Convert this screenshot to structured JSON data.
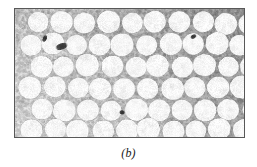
{
  "figure": {
    "caption": "(b)",
    "kind": "micrograph",
    "frame": {
      "x": 14,
      "y": 8,
      "width": 231,
      "height": 130,
      "border_color": "#585858"
    },
    "palette": {
      "page_background": "#ffffff",
      "matrix_light": "#d7d7d7",
      "matrix_mid": "#a8a8a8",
      "matrix_dark": "#6f6f6f",
      "particle_bright": "#fbfbfb",
      "particle_edge": "#dcdcdc",
      "inclusion_dark": "#2b2b2b",
      "caption_color": "#1a1a1a"
    },
    "micrograph_content": {
      "rows": 6,
      "columns_per_row": 10,
      "particle_shape": "circle",
      "particle_mean_radius_px": 11.5,
      "particle_radius_jitter_px": 2.2,
      "packing": "staggered hexagonal",
      "background_gradient": {
        "from": "lighter at lower-left",
        "to": "darker at upper-right"
      },
      "particle_grid": [
        {
          "row": 0,
          "cy": 14,
          "cxs": [
            24,
            48,
            71,
            95,
            119,
            142,
            166,
            190,
            213,
            237
          ],
          "radii": [
            10.5,
            11.5,
            11.0,
            11.8,
            10.6,
            11.4,
            11.2,
            10.9,
            11.6,
            10.4
          ]
        },
        {
          "row": 1,
          "cy": 36,
          "cxs": [
            15,
            38,
            62,
            86,
            109,
            133,
            157,
            180,
            204,
            228
          ],
          "radii": [
            11.0,
            11.7,
            10.8,
            11.3,
            11.9,
            10.7,
            11.5,
            11.1,
            11.8,
            10.9
          ]
        },
        {
          "row": 2,
          "cy": 58,
          "cxs": [
            26,
            50,
            73,
            97,
            121,
            144,
            168,
            192,
            215,
            239
          ],
          "radii": [
            11.4,
            10.6,
            11.9,
            11.2,
            10.8,
            11.6,
            11.0,
            11.7,
            10.5,
            11.3
          ]
        },
        {
          "row": 3,
          "cy": 80,
          "cxs": [
            16,
            40,
            63,
            87,
            111,
            134,
            158,
            182,
            205,
            229
          ],
          "radii": [
            11.8,
            11.1,
            10.7,
            11.5,
            11.2,
            10.9,
            11.7,
            11.0,
            11.4,
            11.9
          ]
        },
        {
          "row": 4,
          "cy": 102,
          "cxs": [
            27,
            51,
            74,
            98,
            122,
            145,
            169,
            193,
            216,
            240
          ],
          "radii": [
            10.9,
            11.6,
            11.2,
            10.6,
            11.8,
            11.3,
            10.8,
            11.5,
            11.1,
            10.7
          ]
        },
        {
          "row": 5,
          "cy": 123,
          "cxs": [
            17,
            41,
            64,
            88,
            112,
            135,
            159,
            183,
            206,
            230
          ],
          "radii": [
            11.3,
            10.8,
            11.7,
            11.0,
            11.4,
            11.9,
            11.2,
            10.6,
            11.6,
            11.1
          ]
        }
      ],
      "dark_inclusions": [
        {
          "cx": 47,
          "cy": 38,
          "rx": 6.5,
          "ry": 3.2,
          "rotation_deg": -18
        },
        {
          "cx": 108,
          "cy": 105,
          "rx": 3.0,
          "ry": 2.2,
          "rotation_deg": 10
        },
        {
          "cx": 180,
          "cy": 28,
          "rx": 3.4,
          "ry": 2.0,
          "rotation_deg": -30
        },
        {
          "cx": 30,
          "cy": 30,
          "rx": 2.0,
          "ry": 4.0,
          "rotation_deg": 25
        }
      ]
    }
  }
}
